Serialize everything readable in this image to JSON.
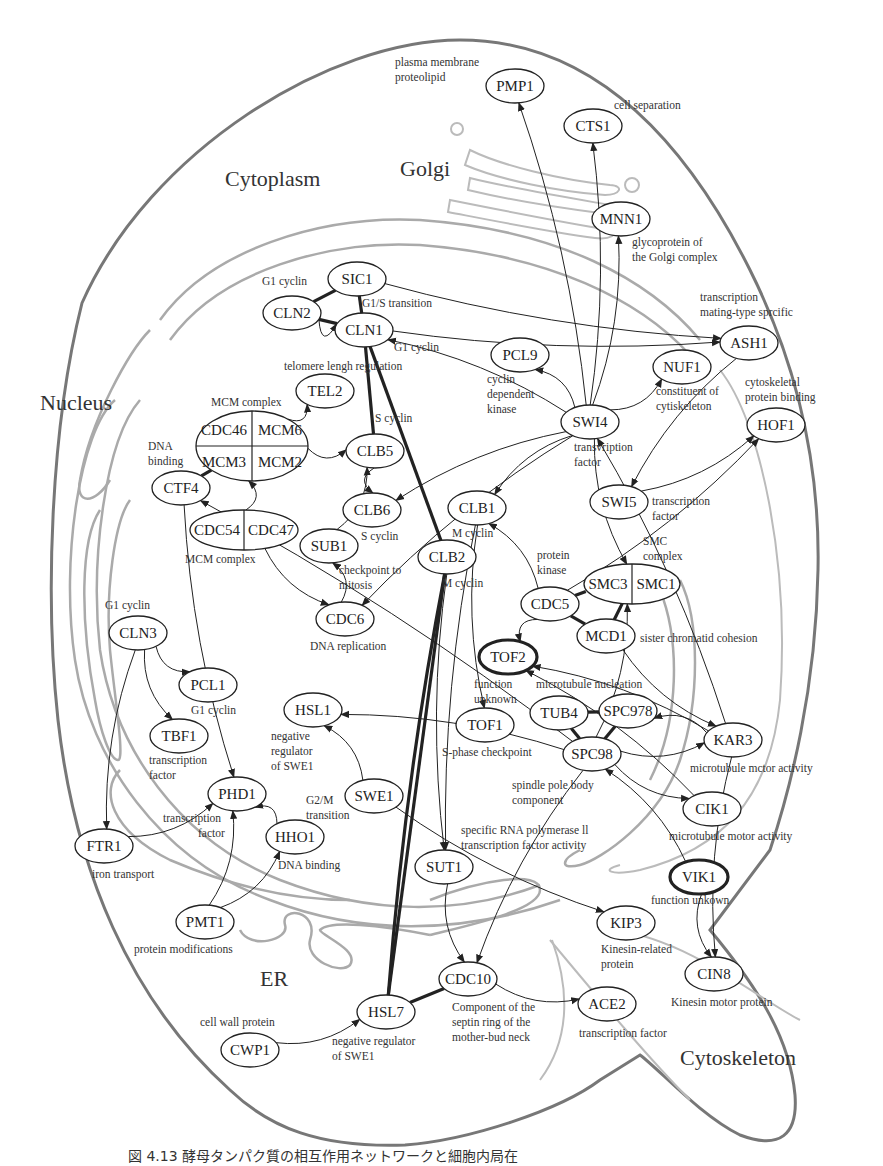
{
  "figure": {
    "caption": "図 4.13  酵母タンパク質の相互作用ネットワークと細胞内局在"
  },
  "regions": [
    {
      "id": "cytoplasm",
      "label": "Cytoplasm",
      "x": 225,
      "y": 186
    },
    {
      "id": "golgi",
      "label": "Golgi",
      "x": 400,
      "y": 176
    },
    {
      "id": "nucleus",
      "label": "Nucleus",
      "x": 40,
      "y": 410
    },
    {
      "id": "er",
      "label": "ER",
      "x": 260,
      "y": 986
    },
    {
      "id": "cytoskeleton",
      "label": "Cytoskeleton",
      "x": 680,
      "y": 1065
    }
  ],
  "nodes": [
    {
      "id": "PMP1",
      "label": "PMP1",
      "x": 515,
      "y": 86,
      "rx": 29,
      "ry": 17
    },
    {
      "id": "CTS1",
      "label": "CTS1",
      "x": 593,
      "y": 126,
      "rx": 29,
      "ry": 17
    },
    {
      "id": "MNN1",
      "label": "MNN1",
      "x": 621,
      "y": 219,
      "rx": 29,
      "ry": 17
    },
    {
      "id": "SIC1",
      "label": "SIC1",
      "x": 357,
      "y": 279,
      "rx": 29,
      "ry": 17
    },
    {
      "id": "CLN2",
      "label": "CLN2",
      "x": 292,
      "y": 313,
      "rx": 29,
      "ry": 17
    },
    {
      "id": "CLN1",
      "label": "CLN1",
      "x": 364,
      "y": 330,
      "rx": 29,
      "ry": 17
    },
    {
      "id": "ASH1",
      "label": "ASH1",
      "x": 749,
      "y": 343,
      "rx": 29,
      "ry": 17
    },
    {
      "id": "PCL9",
      "label": "PCL9",
      "x": 520,
      "y": 355,
      "rx": 29,
      "ry": 17
    },
    {
      "id": "NUF1",
      "label": "NUF1",
      "x": 682,
      "y": 367,
      "rx": 29,
      "ry": 17
    },
    {
      "id": "TEL2",
      "label": "TEL2",
      "x": 325,
      "y": 391,
      "rx": 29,
      "ry": 17
    },
    {
      "id": "SWI4",
      "label": "SWI4",
      "x": 590,
      "y": 422,
      "rx": 29,
      "ry": 17
    },
    {
      "id": "HOF1",
      "label": "HOF1",
      "x": 776,
      "y": 425,
      "rx": 29,
      "ry": 17
    },
    {
      "id": "CLB5",
      "label": "CLB5",
      "x": 375,
      "y": 451,
      "rx": 29,
      "ry": 17
    },
    {
      "id": "CTF4",
      "label": "CTF4",
      "x": 181,
      "y": 488,
      "rx": 29,
      "ry": 17
    },
    {
      "id": "CLB6",
      "label": "CLB6",
      "x": 372,
      "y": 510,
      "rx": 29,
      "ry": 17
    },
    {
      "id": "SWI5",
      "label": "SWI5",
      "x": 619,
      "y": 502,
      "rx": 29,
      "ry": 17
    },
    {
      "id": "CLB1",
      "label": "CLB1",
      "x": 477,
      "y": 508,
      "rx": 29,
      "ry": 17
    },
    {
      "id": "SUB1",
      "label": "SUB1",
      "x": 329,
      "y": 546,
      "rx": 29,
      "ry": 17
    },
    {
      "id": "CLB2",
      "label": "CLB2",
      "x": 447,
      "y": 557,
      "rx": 29,
      "ry": 17
    },
    {
      "id": "CDC5",
      "label": "CDC5",
      "x": 550,
      "y": 604,
      "rx": 29,
      "ry": 17
    },
    {
      "id": "CDC6",
      "label": "CDC6",
      "x": 345,
      "y": 619,
      "rx": 29,
      "ry": 17
    },
    {
      "id": "MCD1",
      "label": "MCD1",
      "x": 606,
      "y": 636,
      "rx": 29,
      "ry": 17
    },
    {
      "id": "CLN3",
      "label": "CLN3",
      "x": 138,
      "y": 633,
      "rx": 29,
      "ry": 17
    },
    {
      "id": "TOF2",
      "label": "TOF2",
      "x": 508,
      "y": 657,
      "rx": 29,
      "ry": 17,
      "bold": true
    },
    {
      "id": "PCL1",
      "label": "PCL1",
      "x": 208,
      "y": 685,
      "rx": 29,
      "ry": 17
    },
    {
      "id": "HSL1",
      "label": "HSL1",
      "x": 313,
      "y": 710,
      "rx": 29,
      "ry": 17
    },
    {
      "id": "TUB4",
      "label": "TUB4",
      "x": 559,
      "y": 713,
      "rx": 29,
      "ry": 17
    },
    {
      "id": "SPC978",
      "label": "SPC978",
      "x": 628,
      "y": 711,
      "rx": 29,
      "ry": 17
    },
    {
      "id": "TBF1",
      "label": "TBF1",
      "x": 179,
      "y": 736,
      "rx": 29,
      "ry": 17
    },
    {
      "id": "TOF1",
      "label": "TOF1",
      "x": 485,
      "y": 725,
      "rx": 29,
      "ry": 17
    },
    {
      "id": "KAR3",
      "label": "KAR3",
      "x": 733,
      "y": 740,
      "rx": 29,
      "ry": 17
    },
    {
      "id": "SPC98",
      "label": "SPC98",
      "x": 592,
      "y": 754,
      "rx": 29,
      "ry": 17
    },
    {
      "id": "PHD1",
      "label": "PHD1",
      "x": 237,
      "y": 794,
      "rx": 29,
      "ry": 17
    },
    {
      "id": "SWE1",
      "label": "SWE1",
      "x": 374,
      "y": 796,
      "rx": 29,
      "ry": 17
    },
    {
      "id": "CIK1",
      "label": "CIK1",
      "x": 712,
      "y": 809,
      "rx": 29,
      "ry": 17
    },
    {
      "id": "HHO1",
      "label": "HHO1",
      "x": 295,
      "y": 837,
      "rx": 29,
      "ry": 17
    },
    {
      "id": "FTR1",
      "label": "FTR1",
      "x": 104,
      "y": 846,
      "rx": 29,
      "ry": 17
    },
    {
      "id": "SUT1",
      "label": "SUT1",
      "x": 444,
      "y": 867,
      "rx": 29,
      "ry": 17
    },
    {
      "id": "VIK1",
      "label": "VIK1",
      "x": 699,
      "y": 877,
      "rx": 29,
      "ry": 17,
      "bold": true
    },
    {
      "id": "PMT1",
      "label": "PMT1",
      "x": 205,
      "y": 922,
      "rx": 29,
      "ry": 17
    },
    {
      "id": "KIP3",
      "label": "KIP3",
      "x": 626,
      "y": 923,
      "rx": 29,
      "ry": 17
    },
    {
      "id": "CDC10",
      "label": "CDC10",
      "x": 468,
      "y": 979,
      "rx": 29,
      "ry": 17
    },
    {
      "id": "CIN8",
      "label": "CIN8",
      "x": 714,
      "y": 974,
      "rx": 29,
      "ry": 17
    },
    {
      "id": "ACE2",
      "label": "ACE2",
      "x": 607,
      "y": 1004,
      "rx": 29,
      "ry": 17
    },
    {
      "id": "HSL7",
      "label": "HSL7",
      "x": 386,
      "y": 1012,
      "rx": 29,
      "ry": 17
    },
    {
      "id": "CWP1",
      "label": "CWP1",
      "x": 250,
      "y": 1050,
      "rx": 29,
      "ry": 17
    }
  ],
  "complexes": [
    {
      "id": "MCM_upper",
      "x": 252,
      "y": 446,
      "rx": 56,
      "ry": 35,
      "cells": [
        "CDC46",
        "MCM6",
        "MCM3",
        "MCM2"
      ],
      "label": "MCM complex"
    },
    {
      "id": "MCM_lower",
      "x": 244,
      "y": 530,
      "rx": 54,
      "ry": 20,
      "cells": [
        "CDC54",
        "CDC47"
      ],
      "label": "MCM complex"
    },
    {
      "id": "SMC",
      "x": 632,
      "y": 584,
      "rx": 48,
      "ry": 20,
      "cells": [
        "SMC3",
        "SMC1"
      ],
      "label": "SMC complex"
    }
  ],
  "annotations": [
    {
      "text": "plasma membrane",
      "x": 395,
      "y": 66
    },
    {
      "text": "proteolipid",
      "x": 395,
      "y": 81
    },
    {
      "text": "cell separation",
      "x": 614,
      "y": 109
    },
    {
      "text": "glycoprotein of",
      "x": 632,
      "y": 246
    },
    {
      "text": "the Golgi complex",
      "x": 632,
      "y": 261
    },
    {
      "text": "G1 cyclin",
      "x": 262,
      "y": 285
    },
    {
      "text": "G1/S transition",
      "x": 362,
      "y": 307
    },
    {
      "text": "transcription",
      "x": 700,
      "y": 301
    },
    {
      "text": "mating-type sprcific",
      "x": 700,
      "y": 316
    },
    {
      "text": "G1 cyclin",
      "x": 394,
      "y": 351
    },
    {
      "text": "telomere lengh regulation",
      "x": 284,
      "y": 370
    },
    {
      "text": "cyclin",
      "x": 487,
      "y": 383
    },
    {
      "text": "dependent",
      "x": 487,
      "y": 398
    },
    {
      "text": "kinase",
      "x": 487,
      "y": 413
    },
    {
      "text": "constituent of",
      "x": 656,
      "y": 395
    },
    {
      "text": "cytiskeleton",
      "x": 656,
      "y": 410
    },
    {
      "text": "cytoskeletal",
      "x": 745,
      "y": 386
    },
    {
      "text": "protein binding",
      "x": 745,
      "y": 401
    },
    {
      "text": "MCM complex",
      "x": 211,
      "y": 406
    },
    {
      "text": "DNA",
      "x": 148,
      "y": 450
    },
    {
      "text": "binding",
      "x": 148,
      "y": 465
    },
    {
      "text": "S cyclin",
      "x": 375,
      "y": 422
    },
    {
      "text": "transvription",
      "x": 574,
      "y": 451
    },
    {
      "text": "factor",
      "x": 574,
      "y": 466
    },
    {
      "text": "transcription",
      "x": 652,
      "y": 505
    },
    {
      "text": "factor",
      "x": 652,
      "y": 520
    },
    {
      "text": "S cyclin",
      "x": 361,
      "y": 540
    },
    {
      "text": "M cyclin",
      "x": 452,
      "y": 537
    },
    {
      "text": "MCM complex",
      "x": 185,
      "y": 563
    },
    {
      "text": "SMC",
      "x": 643,
      "y": 545
    },
    {
      "text": "complex",
      "x": 643,
      "y": 560
    },
    {
      "text": "protein",
      "x": 537,
      "y": 559
    },
    {
      "text": "kinase",
      "x": 537,
      "y": 574
    },
    {
      "text": "checkpoint to",
      "x": 339,
      "y": 574
    },
    {
      "text": "mitosis",
      "x": 339,
      "y": 589
    },
    {
      "text": "M cyclin",
      "x": 442,
      "y": 587
    },
    {
      "text": "G1 cyclin",
      "x": 105,
      "y": 609
    },
    {
      "text": "DNA replication",
      "x": 310,
      "y": 650
    },
    {
      "text": "sister chromatid cohesion",
      "x": 640,
      "y": 642
    },
    {
      "text": "function",
      "x": 474,
      "y": 688
    },
    {
      "text": "unknown",
      "x": 474,
      "y": 703
    },
    {
      "text": "microtubule nucleation",
      "x": 536,
      "y": 688
    },
    {
      "text": "G1 cyclin",
      "x": 191,
      "y": 714
    },
    {
      "text": "negative",
      "x": 271,
      "y": 740
    },
    {
      "text": "regulator",
      "x": 271,
      "y": 755
    },
    {
      "text": "of SWE1",
      "x": 271,
      "y": 770
    },
    {
      "text": "transcription",
      "x": 149,
      "y": 764
    },
    {
      "text": "factor",
      "x": 149,
      "y": 779
    },
    {
      "text": "S-phase checkpoint",
      "x": 442,
      "y": 756
    },
    {
      "text": "microtubule mctor activity",
      "x": 690,
      "y": 772
    },
    {
      "text": "spindle pole body",
      "x": 512,
      "y": 789
    },
    {
      "text": "component",
      "x": 512,
      "y": 804
    },
    {
      "text": "G2/M",
      "x": 306,
      "y": 804
    },
    {
      "text": "transition",
      "x": 306,
      "y": 819
    },
    {
      "text": "transcription",
      "x": 163,
      "y": 822
    },
    {
      "text": "factor",
      "x": 198,
      "y": 837
    },
    {
      "text": "microtubule motor activity",
      "x": 669,
      "y": 840
    },
    {
      "text": "specific RNA polymerase ll",
      "x": 461,
      "y": 834
    },
    {
      "text": "transcription factor activity",
      "x": 461,
      "y": 849
    },
    {
      "text": "DNA binding",
      "x": 278,
      "y": 869
    },
    {
      "text": "iron transport",
      "x": 92,
      "y": 878
    },
    {
      "text": "function unkown",
      "x": 651,
      "y": 904
    },
    {
      "text": "protein modifications",
      "x": 134,
      "y": 953
    },
    {
      "text": "Kinesin-related",
      "x": 601,
      "y": 953
    },
    {
      "text": "protein",
      "x": 601,
      "y": 968
    },
    {
      "text": "Kinesin motor protein",
      "x": 671,
      "y": 1006
    },
    {
      "text": "Component of the",
      "x": 452,
      "y": 1011
    },
    {
      "text": "septin ring of the",
      "x": 452,
      "y": 1026
    },
    {
      "text": "mother-bud neck",
      "x": 452,
      "y": 1041
    },
    {
      "text": "transcription factor",
      "x": 579,
      "y": 1037
    },
    {
      "text": "cell wall protein",
      "x": 200,
      "y": 1026
    },
    {
      "text": "negative regulator",
      "x": 332,
      "y": 1045
    },
    {
      "text": "of SWE1",
      "x": 332,
      "y": 1060
    }
  ],
  "edges": [
    {
      "from": "SIC1",
      "to": "CLN2",
      "type": "interaction",
      "strong": true
    },
    {
      "from": "SIC1",
      "to": "CLN1",
      "type": "interaction",
      "strong": true
    },
    {
      "from": "CLN2",
      "to": "CLN1",
      "type": "interaction",
      "strong": true
    },
    {
      "from": "CLN1",
      "to": "CLB5",
      "type": "interaction",
      "strong": true
    },
    {
      "from": "CLN1",
      "to": "CLB2",
      "type": "interaction",
      "strong": true
    },
    {
      "from": "CLB2",
      "to": "HSL7",
      "type": "interaction",
      "strong": true
    },
    {
      "from": "CLB2",
      "to": "HSL7",
      "type": "interaction",
      "strong": true
    },
    {
      "from": "HSL7",
      "to": "CDC10",
      "type": "interaction",
      "strong": true
    },
    {
      "from": "CDC5",
      "to": "SMC3",
      "type": "interaction",
      "strong": true
    },
    {
      "from": "CDC5",
      "to": "MCD1",
      "type": "interaction",
      "strong": true
    },
    {
      "from": "MCD1",
      "to": "SMC",
      "type": "interaction",
      "strong": true
    },
    {
      "from": "TUB4",
      "to": "SPC978",
      "type": "interaction",
      "strong": true
    },
    {
      "from": "TUB4",
      "to": "SPC98",
      "type": "interaction",
      "strong": true
    },
    {
      "from": "SPC978",
      "to": "SPC98",
      "type": "interaction",
      "strong": true
    },
    {
      "from": "CTF4",
      "to": "MCM_upper",
      "type": "interaction",
      "strong": true
    },
    {
      "from": "SIC1",
      "to": "ASH1",
      "type": "regulation"
    },
    {
      "from": "CLN1",
      "to": "ASH1",
      "type": "regulation"
    },
    {
      "from": "CLN2",
      "to": "CLN1",
      "type": "regulation"
    },
    {
      "from": "MCM_upper",
      "to": "TEL2",
      "type": "regulation"
    },
    {
      "from": "MCM_upper",
      "to": "CLB5",
      "type": "regulation"
    },
    {
      "from": "MCM_lower",
      "to": "MCM_upper",
      "type": "regulation"
    },
    {
      "from": "MCM_lower",
      "to": "CDC6",
      "type": "regulation"
    },
    {
      "from": "CLB5",
      "to": "CLB6",
      "type": "regulation"
    },
    {
      "from": "SUB1",
      "to": "CLB5",
      "type": "regulation"
    },
    {
      "from": "CDC6",
      "to": "SUB1",
      "type": "regulation"
    },
    {
      "from": "SWI4",
      "to": "PMP1",
      "type": "regulation"
    },
    {
      "from": "SWI4",
      "to": "CTS1",
      "type": "regulation"
    },
    {
      "from": "SWI4",
      "to": "MNN1",
      "type": "regulation"
    },
    {
      "from": "SWI4",
      "to": "PCL9",
      "type": "regulation"
    },
    {
      "from": "SWI4",
      "to": "NUF1",
      "type": "regulation"
    },
    {
      "from": "SWI4",
      "to": "CLB1",
      "type": "regulation"
    },
    {
      "from": "SWI4",
      "to": "SMC",
      "type": "regulation"
    },
    {
      "from": "SWI4",
      "to": "CLB6",
      "type": "regulation"
    },
    {
      "from": "SWI4",
      "to": "CDC6",
      "type": "regulation"
    },
    {
      "from": "SWI4",
      "to": "CLN1",
      "type": "regulation"
    },
    {
      "from": "ASH1",
      "to": "SWI5",
      "type": "regulation"
    },
    {
      "from": "SWI5",
      "to": "HOF1",
      "type": "regulation"
    },
    {
      "from": "CDC5",
      "to": "HOF1",
      "type": "regulation"
    },
    {
      "from": "CDC5",
      "to": "CLB1",
      "type": "regulation"
    },
    {
      "from": "CDC5",
      "to": "TOF2",
      "type": "regulation"
    },
    {
      "from": "MCD1",
      "to": "KAR3",
      "type": "regulation"
    },
    {
      "from": "KAR3",
      "to": "TOF2",
      "type": "regulation"
    },
    {
      "from": "CIK1",
      "to": "TOF2",
      "type": "regulation"
    },
    {
      "from": "KAR3",
      "to": "SWI4",
      "type": "regulation"
    },
    {
      "from": "KAR3",
      "to": "SPC978",
      "type": "regulation"
    },
    {
      "from": "SPC98",
      "to": "KAR3",
      "type": "regulation"
    },
    {
      "from": "SPC98",
      "to": "CIK1",
      "type": "regulation"
    },
    {
      "from": "SPC98",
      "to": "SMC",
      "type": "regulation"
    },
    {
      "from": "SPC98",
      "to": "CDC10",
      "type": "regulation"
    },
    {
      "from": "VIK1",
      "to": "SPC98",
      "type": "regulation"
    },
    {
      "from": "VIK1",
      "to": "CIN8",
      "type": "regulation"
    },
    {
      "from": "KAR3",
      "to": "CIN8",
      "type": "regulation"
    },
    {
      "from": "CLB1",
      "to": "TOF1",
      "type": "regulation"
    },
    {
      "from": "CLB1",
      "to": "SUT1",
      "type": "regulation"
    },
    {
      "from": "CLB2",
      "to": "SUT1",
      "type": "regulation"
    },
    {
      "from": "SUT1",
      "to": "CDC10",
      "type": "regulation"
    },
    {
      "from": "CDC10",
      "to": "ACE2",
      "type": "regulation"
    },
    {
      "from": "SWE1",
      "to": "HSL1",
      "type": "regulation"
    },
    {
      "from": "SWE1",
      "to": "KIP3",
      "type": "regulation"
    },
    {
      "from": "CLN3",
      "to": "PCL1",
      "type": "regulation"
    },
    {
      "from": "CLN3",
      "to": "TBF1",
      "type": "regulation"
    },
    {
      "from": "CLN3",
      "to": "FTR1",
      "type": "regulation"
    },
    {
      "from": "FTR1",
      "to": "PHD1",
      "type": "regulation"
    },
    {
      "from": "HHO1",
      "to": "PHD1",
      "type": "regulation"
    },
    {
      "from": "PMT1",
      "to": "PHD1",
      "type": "regulation"
    },
    {
      "from": "PMT1",
      "to": "HHO1",
      "type": "regulation"
    },
    {
      "from": "CWP1",
      "to": "HSL7",
      "type": "regulation"
    },
    {
      "from": "SPC98",
      "to": "HSL1",
      "type": "regulation"
    },
    {
      "from": "SPC98",
      "to": "CTF4",
      "type": "regulation"
    },
    {
      "from": "CTF4",
      "to": "PHD1",
      "type": "regulation"
    }
  ]
}
